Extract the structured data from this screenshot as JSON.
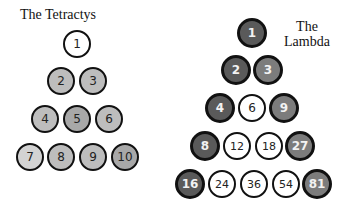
{
  "tetractys": {
    "title": "The Tetractys",
    "rows": [
      [
        {
          "label": "1",
          "shade": "white"
        }
      ],
      [
        {
          "label": "2",
          "shade": "mid"
        },
        {
          "label": "3",
          "shade": "mid"
        }
      ],
      [
        {
          "label": "4",
          "shade": "mid"
        },
        {
          "label": "5",
          "shade": "midgray"
        },
        {
          "label": "6",
          "shade": "mid"
        }
      ],
      [
        {
          "label": "7",
          "shade": "light"
        },
        {
          "label": "8",
          "shade": "mid"
        },
        {
          "label": "9",
          "shade": "mid"
        },
        {
          "label": "10",
          "shade": "midgray"
        }
      ]
    ]
  },
  "lambda": {
    "title_line1": "The",
    "title_line2": "Lambda",
    "rows": [
      [
        {
          "label": "1",
          "shade": "dark"
        }
      ],
      [
        {
          "label": "2",
          "shade": "dark"
        },
        {
          "label": "3",
          "shade": "darkmid"
        }
      ],
      [
        {
          "label": "4",
          "shade": "dark"
        },
        {
          "label": "6",
          "shade": "white"
        },
        {
          "label": "9",
          "shade": "darkmid"
        }
      ],
      [
        {
          "label": "8",
          "shade": "dark"
        },
        {
          "label": "12",
          "shade": "white"
        },
        {
          "label": "18",
          "shade": "white"
        },
        {
          "label": "27",
          "shade": "darkmid"
        }
      ],
      [
        {
          "label": "16",
          "shade": "dark"
        },
        {
          "label": "24",
          "shade": "white"
        },
        {
          "label": "36",
          "shade": "white"
        },
        {
          "label": "54",
          "shade": "white"
        },
        {
          "label": "81",
          "shade": "darkmid"
        }
      ]
    ]
  },
  "colors": {
    "outline": "#111111",
    "white": "#ffffff",
    "light": "#d3d3d3",
    "mid": "#bdbdbd",
    "midgray": "#a8a8a8",
    "dark": "#5a5a5a",
    "darkmid": "#7c7c7c"
  }
}
